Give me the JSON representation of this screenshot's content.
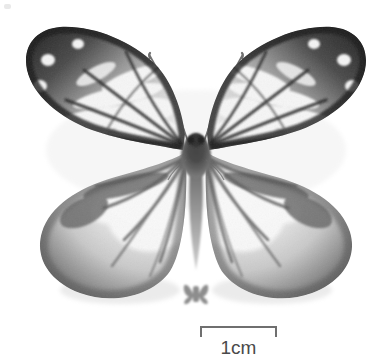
{
  "figure": {
    "kind": "specimen-photograph",
    "background_color": "#ffffff",
    "color_mode": "grayscale",
    "width_px": 392,
    "height_px": 363
  },
  "scalebar": {
    "label": "1cm",
    "length_px": 77,
    "represents_cm": 1,
    "line_color": "#6f6f6f",
    "text_color": "#4a4a4a",
    "tick_style": "downward-end-ticks"
  },
  "size_icon": {
    "name": "actual-size-butterfly-silhouette",
    "color": "#8d8d8d"
  },
  "specimen": {
    "palette": {
      "wing_dark": "#3a3a3a",
      "wing_border": "#2e2e2e",
      "wing_mid": "#7e7e7e",
      "wing_pale": "#f2f2f2",
      "wing_white": "#ffffff",
      "body_dark": "#4b4b4b",
      "body_mid": "#8a8a8a",
      "vein": "#5a5a5a",
      "antenna": "#6a6a6a",
      "shadow": "#d9d9d9"
    },
    "parts": [
      {
        "name": "left-forewing",
        "tone": "dark-bordered-with-white-cells"
      },
      {
        "name": "right-forewing",
        "tone": "dark-bordered-with-white-cells"
      },
      {
        "name": "left-hindwing",
        "tone": "pale-with-dark-veins"
      },
      {
        "name": "right-hindwing",
        "tone": "pale-with-dark-veins"
      },
      {
        "name": "thorax",
        "tone": "dark-gray"
      },
      {
        "name": "abdomen",
        "tone": "mid-gray-tapered"
      },
      {
        "name": "left-antenna",
        "tone": "thin-gray-line"
      },
      {
        "name": "right-antenna",
        "tone": "thin-gray-line"
      },
      {
        "name": "head",
        "tone": "dark-gray"
      }
    ]
  }
}
